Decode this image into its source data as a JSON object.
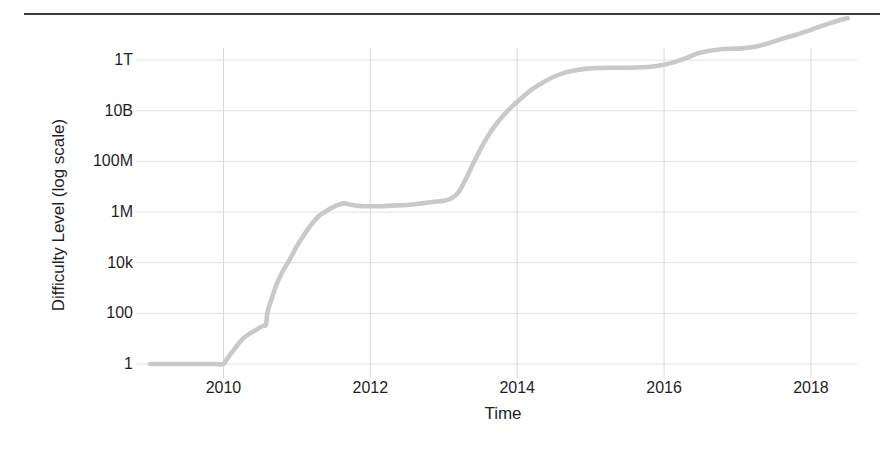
{
  "figure": {
    "background_color": "#ffffff",
    "rule_color": "#3d3d3d",
    "line_color": "#c9c9c9",
    "grid_color": "#e2e2e2",
    "tick_color": "#d8d8d8",
    "text_color": "#1f1f1f"
  },
  "chart_data": {
    "type": "line",
    "title": "",
    "subtitle": "",
    "xlabel": "Time",
    "ylabel": "Difficulty Level (log scale)",
    "legend": [],
    "legend_position": "none",
    "grid": true,
    "yscale": "log",
    "xlim": [
      2009.0,
      2018.6
    ],
    "ylim": [
      1,
      3000000000000
    ],
    "ytick_labels": [
      "1T",
      "10B",
      "100M",
      "1M",
      "10k",
      "100",
      "1"
    ],
    "ytick_values": [
      1000000000000,
      10000000000,
      100000000,
      1000000,
      10000,
      100,
      1
    ],
    "xtick_labels": [
      "2010",
      "2012",
      "2014",
      "2016",
      "2018"
    ],
    "xtick_values": [
      2010,
      2012,
      2014,
      2016,
      2018
    ],
    "series": [
      {
        "name": "Difficulty",
        "x": [
          2009.0,
          2009.1,
          2009.2,
          2009.3,
          2009.4,
          2009.5,
          2009.6,
          2009.7,
          2009.8,
          2009.9,
          2010.0,
          2010.05,
          2010.12,
          2010.2,
          2010.28,
          2010.36,
          2010.44,
          2010.5,
          2010.55,
          2010.58,
          2010.6,
          2010.65,
          2010.72,
          2010.8,
          2010.9,
          2011.0,
          2011.1,
          2011.2,
          2011.3,
          2011.4,
          2011.5,
          2011.58,
          2011.65,
          2011.72,
          2011.8,
          2011.9,
          2012.0,
          2012.15,
          2012.3,
          2012.5,
          2012.7,
          2012.85,
          2013.0,
          2013.1,
          2013.2,
          2013.3,
          2013.4,
          2013.5,
          2013.62,
          2013.75,
          2013.9,
          2014.05,
          2014.2,
          2014.35,
          2014.5,
          2014.65,
          2014.8,
          2014.95,
          2015.1,
          2015.25,
          2015.4,
          2015.55,
          2015.7,
          2015.85,
          2016.0,
          2016.15,
          2016.3,
          2016.45,
          2016.6,
          2016.75,
          2016.9,
          2017.05,
          2017.2,
          2017.35,
          2017.5,
          2017.65,
          2017.8,
          2017.95,
          2018.1,
          2018.25,
          2018.4,
          2018.5
        ],
        "y": [
          1,
          1,
          1,
          1,
          1,
          1,
          1,
          1,
          1,
          1,
          1,
          1.6,
          3.0,
          6.0,
          11,
          16,
          22,
          28,
          33,
          36,
          110,
          330,
          1300,
          4200,
          13000.0,
          45000.0,
          130000.0,
          330000.0,
          700000.0,
          1100000.0,
          1600000.0,
          2000000.0,
          2200000.0,
          2000000.0,
          1800000.0,
          1700000.0,
          1700000.0,
          1700000.0,
          1800000.0,
          1900000.0,
          2200000.0,
          2500000.0,
          2800000.0,
          3400000.0,
          6000000.0,
          20000000.0,
          80000000.0,
          300000000.0,
          1200000000.0,
          4000000000.0,
          12000000000.0,
          30000000000.0,
          70000000000.0,
          130000000000.0,
          220000000000.0,
          320000000000.0,
          400000000000.0,
          460000000000.0,
          490000000000.0,
          500000000000.0,
          500000000000.0,
          500000000000.0,
          520000000000.0,
          560000000000.0,
          650000000000.0,
          850000000000.0,
          1200000000000.0,
          1800000000000.0,
          2300000000000.0,
          2600000000000.0,
          2800000000000.0,
          2900000000000.0,
          3200000000000.0,
          4000000000000.0,
          5500000000000.0,
          7500000000000.0,
          10000000000000.0,
          14000000000000.0,
          20000000000000.0,
          28000000000000.0,
          38000000000000.0,
          45000000000000.0
        ]
      }
    ]
  },
  "axes": {
    "y_title": "Difficulty Level (log scale)",
    "x_title": "Time",
    "y_ticks": [
      {
        "label": "1T"
      },
      {
        "label": "10B"
      },
      {
        "label": "100M"
      },
      {
        "label": "1M"
      },
      {
        "label": "10k"
      },
      {
        "label": "100"
      },
      {
        "label": "1"
      }
    ],
    "x_ticks": [
      {
        "label": "2010"
      },
      {
        "label": "2012"
      },
      {
        "label": "2014"
      },
      {
        "label": "2016"
      },
      {
        "label": "2018"
      }
    ]
  }
}
